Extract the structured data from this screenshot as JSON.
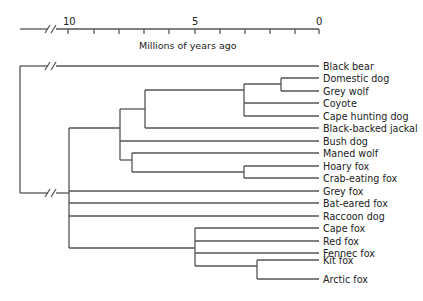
{
  "axis": {
    "title": "Millions of years ago",
    "tick_labels": [
      {
        "value": "10",
        "x": 68
      },
      {
        "value": "5",
        "x": 195
      },
      {
        "value": "0",
        "x": 319
      }
    ],
    "ticks_x": [
      68,
      94,
      119,
      144,
      169,
      195,
      220,
      245,
      270,
      295,
      319
    ],
    "line_start_x": 20,
    "line_end_x": 319,
    "y": 29,
    "break_x": 52
  },
  "taxa": [
    "Black bear",
    "Domestic dog",
    "Grey wolf",
    "Coyote",
    "Cape hunting dog",
    "Black-backed jackal",
    "Bush dog",
    "Maned wolf",
    "Hoary fox",
    "Crab-eating fox",
    "Grey fox",
    "Bat-eared fox",
    "Raccoon dog",
    "Cape fox",
    "Red fox",
    "Fennec fox",
    "Kit fox",
    "Arctic fox"
  ],
  "colors": {
    "line": "#555555",
    "text": "#222222",
    "background": "#ffffff"
  }
}
